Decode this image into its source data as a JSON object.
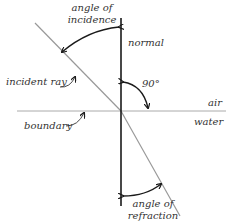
{
  "diagram": {
    "type": "refraction-of-light",
    "labels": {
      "angle_of_incidence": [
        "angle of",
        "incidence"
      ],
      "normal": "normal",
      "incident_ray": "incident ray",
      "right_angle": "90°",
      "air": "air",
      "water": "water",
      "boundary": "boundary",
      "angle_of_refraction": [
        "angle of",
        "refraction"
      ]
    },
    "colors": {
      "normal_line": "#1a1a1a",
      "ray_line": "#999999",
      "boundary_line": "#aaaaaa",
      "arrow": "#1a1a1a",
      "text": "#333333"
    }
  }
}
